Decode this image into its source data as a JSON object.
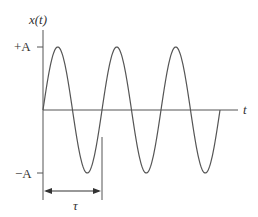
{
  "diagram": {
    "y_axis_label": "x(t)",
    "x_axis_label": "t",
    "plus_amplitude_label": "+A",
    "minus_amplitude_label": "−A",
    "period_label": "τ",
    "cycles_shown": 3,
    "stroke_color": "#555555"
  },
  "chart_data": {
    "type": "line",
    "title": "",
    "xlabel": "t",
    "ylabel": "x(t)",
    "function": "x(t) = A sin(2π t / τ)",
    "x_range_periods": [
      0,
      3
    ],
    "y_ticks": [
      "+A",
      "−A"
    ],
    "annotations": [
      "τ (period, marked with double arrow between 0 and τ)"
    ]
  }
}
